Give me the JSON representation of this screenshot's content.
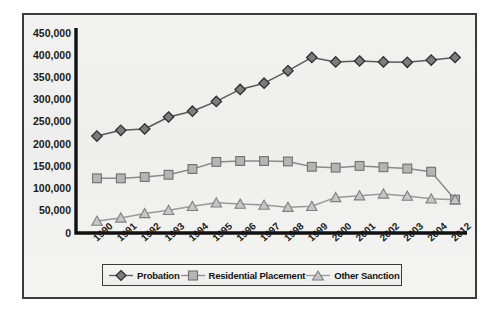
{
  "chart_data": {
    "type": "line",
    "title": "",
    "xlabel": "",
    "ylabel": "",
    "ylim": [
      0,
      450000
    ],
    "ytick_step": 50000,
    "grid": false,
    "legend_position": "bottom",
    "categories": [
      "1990",
      "1991",
      "1992",
      "1993",
      "1994",
      "1995",
      "1996",
      "1997",
      "1998",
      "1999",
      "2000",
      "2001",
      "2002",
      "2003",
      "2004",
      "2012"
    ],
    "ytick_labels": [
      "450,000",
      "400,000",
      "350,000",
      "300,000",
      "250,000",
      "200,000",
      "150,000",
      "100,000",
      "50,000",
      "0"
    ],
    "ytick_values": [
      450000,
      400000,
      350000,
      300000,
      250000,
      200000,
      150000,
      100000,
      50000,
      0
    ],
    "series": [
      {
        "name": "Probation",
        "marker": "diamond",
        "color": "#7d7d7d",
        "line_color": "#5a5a5a",
        "values": [
          218000,
          231000,
          234000,
          261000,
          274000,
          296000,
          323000,
          337000,
          365000,
          395000,
          385000,
          387000,
          385000,
          384000,
          389000,
          395000
        ]
      },
      {
        "name": "Residential Placement",
        "marker": "square",
        "color": "#b5b5b5",
        "line_color": "#8a8a8a",
        "values": [
          123000,
          123000,
          126000,
          131000,
          144000,
          160000,
          162000,
          162000,
          161000,
          149000,
          147000,
          151000,
          148000,
          145000,
          138000,
          75000
        ]
      },
      {
        "name": "Other Sanction",
        "marker": "triangle",
        "color": "#c6c6c6",
        "line_color": "#9a9a9a",
        "values": [
          27000,
          34000,
          44000,
          51000,
          60000,
          68000,
          65000,
          63000,
          58000,
          60000,
          80000,
          84000,
          88000,
          83000,
          77000,
          75000
        ]
      }
    ]
  },
  "legend": {
    "items": [
      {
        "label": "Probation",
        "icon": "diamond-marker-icon"
      },
      {
        "label": "Residential Placement",
        "icon": "square-marker-icon"
      },
      {
        "label": "Other Sanction",
        "icon": "triangle-marker-icon"
      }
    ]
  },
  "colors": {
    "frame_border": "#3b3b3b",
    "axis": "#111111",
    "plot_background": "#f1f1ef",
    "page_background": "#ffffff"
  }
}
